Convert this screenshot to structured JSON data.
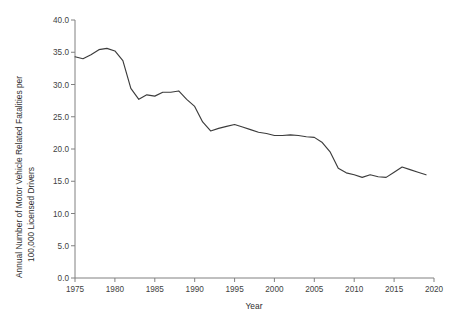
{
  "chart_data": {
    "type": "line",
    "title": "",
    "subtitle": "",
    "xlabel": "Year",
    "ylabel": "Annual Number of Motor Vehicle Related Fatalities per 100,000 Licensed Drivers",
    "ylabel_line1": "Annual Number of Motor Vehicle Related Fatalities per",
    "ylabel_line2": "100,000 Licensed Drivers",
    "xlim": [
      1975,
      2020
    ],
    "ylim": [
      0.0,
      40.0
    ],
    "grid": false,
    "legend": "none",
    "xticks": [
      1975,
      1980,
      1985,
      1990,
      1995,
      2000,
      2005,
      2010,
      2015,
      2020
    ],
    "xtick_labels": [
      "1975",
      "1980",
      "1985",
      "1990",
      "1995",
      "2000",
      "2005",
      "2010",
      "2015",
      "2020"
    ],
    "yticks": [
      0.0,
      5.0,
      10.0,
      15.0,
      20.0,
      25.0,
      30.0,
      35.0,
      40.0
    ],
    "ytick_labels": [
      "0.0",
      "5.0",
      "10.0",
      "15.0",
      "20.0",
      "25.0",
      "30.0",
      "35.0",
      "40.0"
    ],
    "line_color": "#3c3c3c",
    "axis_color": "#808080",
    "x": [
      1975,
      1976,
      1977,
      1978,
      1979,
      1980,
      1981,
      1982,
      1983,
      1984,
      1985,
      1986,
      1987,
      1988,
      1989,
      1990,
      1991,
      1992,
      1993,
      1994,
      1995,
      1996,
      1997,
      1998,
      1999,
      2000,
      2001,
      2002,
      2003,
      2004,
      2005,
      2006,
      2007,
      2008,
      2009,
      2010,
      2011,
      2012,
      2013,
      2014,
      2015,
      2016,
      2017,
      2018,
      2019
    ],
    "series": [
      {
        "name": "Fatality rate per 100,000 licensed drivers",
        "values": [
          34.3,
          34.0,
          34.6,
          35.4,
          35.6,
          35.2,
          33.7,
          29.4,
          27.7,
          28.4,
          28.2,
          28.8,
          28.8,
          29.0,
          27.7,
          26.6,
          24.2,
          22.8,
          23.2,
          23.5,
          23.8,
          23.4,
          23.0,
          22.6,
          22.4,
          22.1,
          22.1,
          22.2,
          22.1,
          21.9,
          21.8,
          21.0,
          19.5,
          17.0,
          16.3,
          16.0,
          15.6,
          16.0,
          15.7,
          15.6,
          16.4,
          17.2,
          16.8,
          16.4,
          16.0
        ]
      }
    ]
  }
}
